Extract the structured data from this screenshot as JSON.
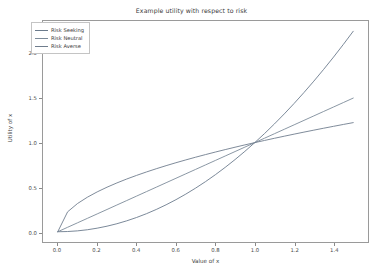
{
  "chart_data": {
    "type": "line",
    "title": "Example utility with respect to risk",
    "xlabel": "Value of x",
    "ylabel": "Utility of x",
    "xlim": [
      -0.075,
      1.575
    ],
    "ylim": [
      -0.115,
      2.365
    ],
    "xticks": [
      "0.0",
      "0.2",
      "0.4",
      "0.6",
      "0.8",
      "1.0",
      "1.2",
      "1.4"
    ],
    "xtick_values": [
      0.0,
      0.2,
      0.4,
      0.6,
      0.8,
      1.0,
      1.2,
      1.4
    ],
    "yticks": [
      "0.0",
      "0.5",
      "1.0",
      "1.5",
      "2.0"
    ],
    "ytick_values": [
      0.0,
      0.5,
      1.0,
      1.5,
      2.0
    ],
    "grid": false,
    "legend_position": "upper left",
    "x": [
      0.0,
      0.05,
      0.1,
      0.15,
      0.2,
      0.25,
      0.3,
      0.35,
      0.4,
      0.45,
      0.5,
      0.55,
      0.6,
      0.65,
      0.7,
      0.75,
      0.8,
      0.85,
      0.9,
      0.95,
      1.0,
      1.05,
      1.1,
      1.15,
      1.2,
      1.25,
      1.3,
      1.35,
      1.4,
      1.45,
      1.5
    ],
    "series": [
      {
        "name": "Risk Seeking",
        "color": "#6b7b8c",
        "formula": "x^2",
        "values": [
          0.0,
          0.0025,
          0.01,
          0.0225,
          0.04,
          0.0625,
          0.09,
          0.1225,
          0.16,
          0.2025,
          0.25,
          0.3025,
          0.36,
          0.4225,
          0.49,
          0.5625,
          0.64,
          0.7225,
          0.81,
          0.9025,
          1.0,
          1.1025,
          1.21,
          1.3225,
          1.44,
          1.5625,
          1.69,
          1.8225,
          1.96,
          2.1025,
          2.25
        ]
      },
      {
        "name": "Risk Neutral",
        "color": "#7c8a99",
        "formula": "x",
        "values": [
          0.0,
          0.05,
          0.1,
          0.15,
          0.2,
          0.25,
          0.3,
          0.35,
          0.4,
          0.45,
          0.5,
          0.55,
          0.6,
          0.65,
          0.7,
          0.75,
          0.8,
          0.85,
          0.9,
          0.95,
          1.0,
          1.05,
          1.1,
          1.15,
          1.2,
          1.25,
          1.3,
          1.35,
          1.4,
          1.45,
          1.5
        ]
      },
      {
        "name": "Risk Averse",
        "color": "#6f7d8d",
        "formula": "sqrt(x)",
        "values": [
          0.0,
          0.2236,
          0.3162,
          0.3873,
          0.4472,
          0.5,
          0.5477,
          0.5916,
          0.6325,
          0.6708,
          0.7071,
          0.7416,
          0.7746,
          0.8062,
          0.8367,
          0.866,
          0.8944,
          0.9219,
          0.9487,
          0.9747,
          1.0,
          1.0247,
          1.0488,
          1.0724,
          1.0954,
          1.118,
          1.1402,
          1.1619,
          1.1832,
          1.2042,
          1.2247
        ]
      }
    ]
  },
  "legend": {
    "entries": [
      {
        "label": "Risk Seeking"
      },
      {
        "label": "Risk Neutral"
      },
      {
        "label": "Risk Averse"
      }
    ]
  },
  "colors": {
    "axis": "#9a9a9a",
    "tick": "#8a8a8a",
    "text": "#3a3a3a",
    "background": "#ffffff"
  }
}
